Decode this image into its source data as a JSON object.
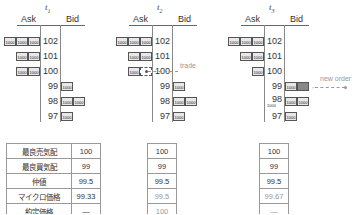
{
  "panels": [
    {
      "title": "t",
      "sub": "1",
      "ask_label": "Ask",
      "bid_label": "Bid",
      "prices": [
        "102",
        "101",
        "100",
        "99",
        "98",
        "97"
      ],
      "asks": [
        [
          "1000",
          "1000",
          "1000"
        ],
        [
          "1000",
          "1000"
        ],
        [
          "1000",
          "1000"
        ],
        [],
        [],
        []
      ],
      "bids": [
        [],
        [],
        [],
        [
          "1000"
        ],
        [
          "1000",
          "1000"
        ],
        [
          "1000"
        ]
      ]
    },
    {
      "title": "t",
      "sub": "2",
      "ask_label": "Ask",
      "bid_label": "Bid",
      "prices": [
        "102",
        "101",
        "100",
        "99",
        "98",
        "97"
      ],
      "asks": [
        [
          "1000",
          "1000",
          "1000"
        ],
        [
          "1000",
          "1000"
        ],
        [
          "1000"
        ],
        [],
        [],
        []
      ],
      "bids": [
        [],
        [],
        [],
        [
          "1000"
        ],
        [
          "1000",
          "1000"
        ],
        [
          "1000"
        ]
      ],
      "annotation": "trade"
    },
    {
      "title": "t",
      "sub": "3",
      "ask_label": "Ask",
      "bid_label": "Bid",
      "prices": [
        "102",
        "101",
        "100",
        "99",
        "98",
        "97"
      ],
      "asks": [
        [
          "1000",
          "1000",
          "1000"
        ],
        [
          "1000",
          "1000"
        ],
        [
          "1000"
        ],
        [],
        [],
        []
      ],
      "bids": [
        [],
        [],
        [],
        [
          "1000"
        ],
        [
          "1000",
          "1000"
        ],
        [
          "1000"
        ]
      ],
      "annotation": "new order",
      "small_label": "1000"
    }
  ],
  "table": {
    "labels": [
      "最良売気配",
      "最良買気配",
      "仲値",
      "マイクロ価格",
      "約定価格"
    ],
    "t1": [
      "100",
      "99",
      "99.5",
      "99.33",
      "—"
    ],
    "t2": [
      "100",
      "99",
      "99.5",
      "99.5",
      "100"
    ],
    "t3": [
      "100",
      "99",
      "99.5",
      "99.67",
      "—"
    ]
  }
}
